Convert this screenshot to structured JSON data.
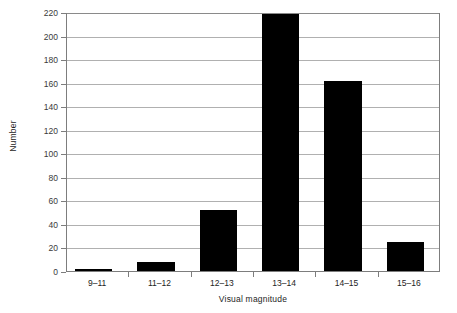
{
  "chart_data": {
    "type": "bar",
    "title": "",
    "xlabel": "Visual magnitude",
    "ylabel": "Number",
    "categories": [
      "9–11",
      "11–12",
      "12–13",
      "13–14",
      "14–15",
      "15–16"
    ],
    "values": [
      2,
      8,
      52,
      218,
      161,
      25
    ],
    "ylim": [
      0,
      220
    ],
    "ytick_step": 20,
    "yticks": [
      0,
      20,
      40,
      60,
      80,
      100,
      120,
      140,
      160,
      180,
      200,
      220
    ],
    "ytick_labels": [
      "0",
      "20",
      "40",
      "60",
      "80",
      "100",
      "120",
      "140",
      "160",
      "180",
      "200",
      "220"
    ],
    "grid": true,
    "grid_axis": "y",
    "legend": false,
    "bar_color": "#000000",
    "gridline_color": "#b0b0b0",
    "axis_color": "#7d7d7d",
    "background_color": "#ffffff"
  }
}
